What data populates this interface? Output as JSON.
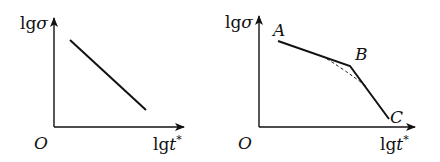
{
  "diagrams": [
    {
      "id": "left",
      "y_axis_label": {
        "prefix": "lg",
        "symbol": "σ"
      },
      "x_axis_label": {
        "prefix": "lg",
        "symbol": "t",
        "superscript": "*"
      },
      "origin_label": "O",
      "curve": "single straight descending line",
      "points": []
    },
    {
      "id": "right",
      "y_axis_label": {
        "prefix": "lg",
        "symbol": "σ"
      },
      "x_axis_label": {
        "prefix": "lg",
        "symbol": "t",
        "superscript": "*"
      },
      "origin_label": "O",
      "curve": "bilinear descending polyline with dashed smooth transition near knee",
      "points": [
        {
          "label": "A"
        },
        {
          "label": "B"
        },
        {
          "label": "C"
        }
      ]
    }
  ],
  "colors": {
    "line": "#111111",
    "background": "#ffffff"
  }
}
